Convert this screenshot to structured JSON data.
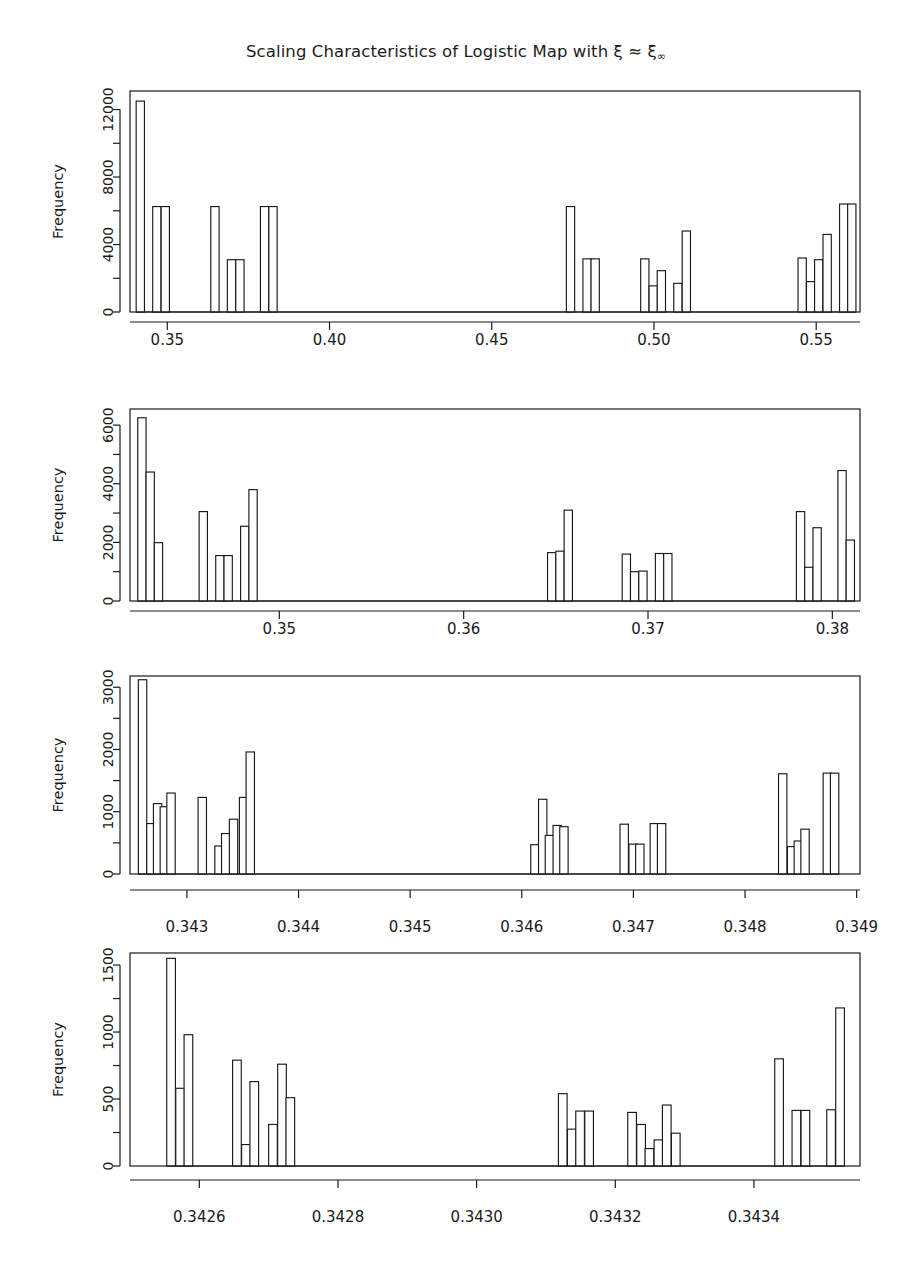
{
  "figure": {
    "title_main": "Scaling Characteristics of Logistic Map with ξ ≈ ξ",
    "title_sub": "∞",
    "title_full": "Scaling Characteristics of Logistic Map with ξ ≈ ξ∞",
    "background": "#ffffff",
    "ink": "#1a1a1a",
    "panel_count": 4
  },
  "chart_data": [
    {
      "type": "bar",
      "title": "Scaling Characteristics of Logistic Map with ξ ≈ ξ∞",
      "panel_index": 1,
      "xlabel": "",
      "ylabel": "Frequency",
      "grid": false,
      "legend": null,
      "xlim": [
        0.3385,
        0.5635
      ],
      "ylim": [
        0,
        13100
      ],
      "xticks": [
        0.35,
        0.4,
        0.45,
        0.5,
        0.55
      ],
      "xticklabels": [
        "0.35",
        "0.40",
        "0.45",
        "0.50",
        "0.55"
      ],
      "yticks": [
        0,
        4000,
        8000,
        12000
      ],
      "yticklabels": [
        "0",
        "4000",
        "8000",
        "12000"
      ],
      "yminorticks": [
        2000,
        6000,
        10000
      ],
      "bin_width": 0.00255,
      "bars": [
        {
          "x": 0.3404,
          "value": 12500
        },
        {
          "x": 0.3455,
          "value": 6250
        },
        {
          "x": 0.3481,
          "value": 6250
        },
        {
          "x": 0.3634,
          "value": 6250
        },
        {
          "x": 0.3685,
          "value": 3100
        },
        {
          "x": 0.3711,
          "value": 3100
        },
        {
          "x": 0.3787,
          "value": 6250
        },
        {
          "x": 0.3813,
          "value": 6250
        },
        {
          "x": 0.473,
          "value": 6250
        },
        {
          "x": 0.4781,
          "value": 3150
        },
        {
          "x": 0.4806,
          "value": 3150
        },
        {
          "x": 0.4959,
          "value": 3150
        },
        {
          "x": 0.4985,
          "value": 1550
        },
        {
          "x": 0.501,
          "value": 2450
        },
        {
          "x": 0.5061,
          "value": 1700
        },
        {
          "x": 0.5087,
          "value": 4800
        },
        {
          "x": 0.5444,
          "value": 3200
        },
        {
          "x": 0.547,
          "value": 1800
        },
        {
          "x": 0.5495,
          "value": 3100
        },
        {
          "x": 0.5521,
          "value": 4600
        },
        {
          "x": 0.5572,
          "value": 6400
        },
        {
          "x": 0.5597,
          "value": 6400
        }
      ]
    },
    {
      "type": "bar",
      "panel_index": 2,
      "xlabel": "",
      "ylabel": "Frequency",
      "grid": false,
      "legend": null,
      "xlim": [
        0.3419,
        0.3815
      ],
      "ylim": [
        0,
        6550
      ],
      "xticks": [
        0.35,
        0.36,
        0.37,
        0.38
      ],
      "xticklabels": [
        "0.35",
        "0.36",
        "0.37",
        "0.38"
      ],
      "yticks": [
        0,
        2000,
        4000,
        6000
      ],
      "yticklabels": [
        "0",
        "2000",
        "4000",
        "6000"
      ],
      "yminorticks": [
        1000,
        3000,
        5000
      ],
      "bin_width": 0.00045,
      "bars": [
        {
          "x": 0.34232,
          "value": 6250
        },
        {
          "x": 0.34277,
          "value": 4400
        },
        {
          "x": 0.34322,
          "value": 1990
        },
        {
          "x": 0.34565,
          "value": 3050
        },
        {
          "x": 0.34655,
          "value": 1550
        },
        {
          "x": 0.347,
          "value": 1550
        },
        {
          "x": 0.3479,
          "value": 2550
        },
        {
          "x": 0.34835,
          "value": 3800
        },
        {
          "x": 0.36455,
          "value": 1650
        },
        {
          "x": 0.365,
          "value": 1700
        },
        {
          "x": 0.36545,
          "value": 3100
        },
        {
          "x": 0.3686,
          "value": 1600
        },
        {
          "x": 0.36905,
          "value": 1000
        },
        {
          "x": 0.3695,
          "value": 1020
        },
        {
          "x": 0.3704,
          "value": 1620
        },
        {
          "x": 0.37085,
          "value": 1620
        },
        {
          "x": 0.37805,
          "value": 3050
        },
        {
          "x": 0.3785,
          "value": 1150
        },
        {
          "x": 0.37895,
          "value": 2500
        },
        {
          "x": 0.3803,
          "value": 4450
        },
        {
          "x": 0.38075,
          "value": 2080
        }
      ]
    },
    {
      "type": "bar",
      "panel_index": 3,
      "xlabel": "",
      "ylabel": "Frequency",
      "grid": false,
      "legend": null,
      "xlim": [
        0.34249,
        0.34903
      ],
      "ylim": [
        0,
        3180
      ],
      "xticks": [
        0.343,
        0.344,
        0.345,
        0.346,
        0.347,
        0.348,
        0.349
      ],
      "xticklabels": [
        "0.343",
        "0.344",
        "0.345",
        "0.346",
        "0.347",
        "0.348",
        "0.349"
      ],
      "yticks": [
        0,
        1000,
        2000,
        3000
      ],
      "yticklabels": [
        "0",
        "1000",
        "2000",
        "3000"
      ],
      "yminorticks": [
        500,
        1500,
        2500
      ],
      "bin_width": 7.5e-05,
      "bars": [
        {
          "x": 0.342565,
          "value": 3120
        },
        {
          "x": 0.34264,
          "value": 810
        },
        {
          "x": 0.3427,
          "value": 1130
        },
        {
          "x": 0.34276,
          "value": 1080
        },
        {
          "x": 0.34282,
          "value": 1300
        },
        {
          "x": 0.3431,
          "value": 1230
        },
        {
          "x": 0.34325,
          "value": 450
        },
        {
          "x": 0.34331,
          "value": 650
        },
        {
          "x": 0.34338,
          "value": 880
        },
        {
          "x": 0.34347,
          "value": 1230
        },
        {
          "x": 0.34353,
          "value": 1960
        },
        {
          "x": 0.34608,
          "value": 470
        },
        {
          "x": 0.34615,
          "value": 1200
        },
        {
          "x": 0.34621,
          "value": 620
        },
        {
          "x": 0.34628,
          "value": 780
        },
        {
          "x": 0.34634,
          "value": 760
        },
        {
          "x": 0.34688,
          "value": 800
        },
        {
          "x": 0.34696,
          "value": 480
        },
        {
          "x": 0.34702,
          "value": 480
        },
        {
          "x": 0.34715,
          "value": 810
        },
        {
          "x": 0.347215,
          "value": 810
        },
        {
          "x": 0.3483,
          "value": 1610
        },
        {
          "x": 0.34838,
          "value": 440
        },
        {
          "x": 0.34844,
          "value": 530
        },
        {
          "x": 0.3485,
          "value": 720
        },
        {
          "x": 0.3487,
          "value": 1620
        },
        {
          "x": 0.348765,
          "value": 1620
        }
      ]
    },
    {
      "type": "bar",
      "panel_index": 4,
      "xlabel": "",
      "ylabel": "Frequency",
      "grid": false,
      "legend": null,
      "xlim": [
        0.3425,
        0.343553
      ],
      "ylim": [
        0,
        1590
      ],
      "xticks": [
        0.3426,
        0.3428,
        0.343,
        0.3432,
        0.3434
      ],
      "xticklabels": [
        "0.3426",
        "0.3428",
        "0.3430",
        "0.3432",
        "0.3434"
      ],
      "yticks": [
        0,
        500,
        1000,
        1500
      ],
      "yticklabels": [
        "0",
        "500",
        "1000",
        "1500"
      ],
      "yminorticks": [
        250,
        750,
        1250
      ],
      "bin_width": 1.25e-05,
      "bars": [
        {
          "x": 0.342553,
          "value": 1550
        },
        {
          "x": 0.342566,
          "value": 580
        },
        {
          "x": 0.342578,
          "value": 980
        },
        {
          "x": 0.342648,
          "value": 790
        },
        {
          "x": 0.342661,
          "value": 160
        },
        {
          "x": 0.342673,
          "value": 630
        },
        {
          "x": 0.3427,
          "value": 310
        },
        {
          "x": 0.342713,
          "value": 760
        },
        {
          "x": 0.342725,
          "value": 510
        },
        {
          "x": 0.343118,
          "value": 540
        },
        {
          "x": 0.343131,
          "value": 275
        },
        {
          "x": 0.343143,
          "value": 410
        },
        {
          "x": 0.343156,
          "value": 410
        },
        {
          "x": 0.343218,
          "value": 400
        },
        {
          "x": 0.343231,
          "value": 310
        },
        {
          "x": 0.343243,
          "value": 130
        },
        {
          "x": 0.343256,
          "value": 195
        },
        {
          "x": 0.343268,
          "value": 455
        },
        {
          "x": 0.343281,
          "value": 245
        },
        {
          "x": 0.34343,
          "value": 800
        },
        {
          "x": 0.343455,
          "value": 415
        },
        {
          "x": 0.343468,
          "value": 415
        },
        {
          "x": 0.343505,
          "value": 420
        },
        {
          "x": 0.343518,
          "value": 1180
        }
      ]
    }
  ]
}
